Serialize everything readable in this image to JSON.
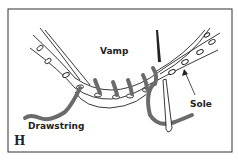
{
  "figure": {
    "panel_letter": "H",
    "labels": {
      "vamp": "Vamp",
      "sole": "Sole",
      "drawstring": "Drawstring"
    },
    "colors": {
      "line": "#222222",
      "string": "#6b6b6b",
      "background": "#ffffff"
    }
  }
}
